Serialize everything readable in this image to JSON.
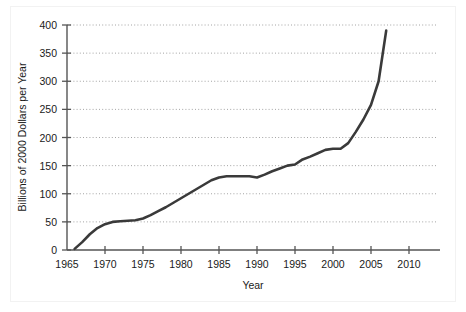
{
  "chart_data": {
    "type": "line",
    "title": "",
    "xlabel": "Year",
    "ylabel": "Billions of 2000 Dollars per Year",
    "xlim": [
      1965,
      2010
    ],
    "ylim": [
      0,
      400
    ],
    "grid": true,
    "grid_axis": "y",
    "legend": "none",
    "xticks": [
      1965,
      1970,
      1975,
      1980,
      1985,
      1990,
      1995,
      2000,
      2005,
      2010
    ],
    "xtick_labels": [
      "1965",
      "1970",
      "1975",
      "1980",
      "1985",
      "1990",
      "1995",
      "2000",
      "2005",
      "2010"
    ],
    "yticks": [
      0,
      50,
      100,
      150,
      200,
      250,
      300,
      350,
      400
    ],
    "ytick_labels": [
      "0",
      "50",
      "100",
      "150",
      "200",
      "250",
      "300",
      "350",
      "400"
    ],
    "line_color": "#3a3a3a",
    "line_width": 2.6,
    "series": [
      {
        "name": "Spending",
        "x": [
          1966.0,
          1967.0,
          1968.0,
          1969.0,
          1970.0,
          1971.0,
          1972.0,
          1973.0,
          1974.0,
          1975.0,
          1976.0,
          1977.0,
          1978.0,
          1979.0,
          1980.0,
          1981.0,
          1982.0,
          1983.0,
          1984.0,
          1985.0,
          1986.0,
          1987.0,
          1988.0,
          1989.0,
          1990.0,
          1991.0,
          1992.0,
          1993.0,
          1994.0,
          1995.0,
          1996.0,
          1997.0,
          1998.0,
          1999.0,
          2000.0,
          2001.0,
          2002.0,
          2003.0,
          2004.0,
          2005.0,
          2006.0,
          2007.0
        ],
        "y": [
          2,
          14,
          28,
          39,
          46,
          50,
          51,
          52,
          53,
          56,
          62,
          69,
          76,
          84,
          92,
          100,
          108,
          116,
          124,
          129,
          131,
          131,
          131,
          131,
          129,
          134,
          140,
          145,
          150,
          152,
          161,
          166,
          172,
          178,
          180,
          180,
          190,
          210,
          232,
          258,
          300,
          390
        ]
      }
    ]
  },
  "axis": {
    "y_title": "Billions of 2000 Dollars per Year",
    "x_title": "Year"
  }
}
